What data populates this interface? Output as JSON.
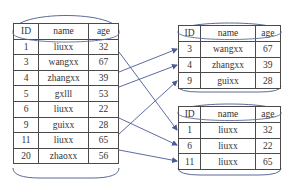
{
  "diagram": {
    "type": "table-partition",
    "columns": [
      "ID",
      "name",
      "age"
    ],
    "source_table": {
      "rows": [
        [
          "1",
          "liuxx",
          "32"
        ],
        [
          "3",
          "wangxx",
          "67"
        ],
        [
          "4",
          "zhangxx",
          "39"
        ],
        [
          "5",
          "gxlll",
          "53"
        ],
        [
          "6",
          "liuxx",
          "22"
        ],
        [
          "9",
          "guixx",
          "28"
        ],
        [
          "11",
          "liuxx",
          "65"
        ],
        [
          "20",
          "zhaoxx",
          "56"
        ]
      ]
    },
    "target_table_top": {
      "rows": [
        [
          "3",
          "wangxx",
          "67"
        ],
        [
          "4",
          "zhangxx",
          "39"
        ],
        [
          "9",
          "guixx",
          "28"
        ]
      ]
    },
    "target_table_bottom": {
      "rows": [
        [
          "1",
          "liuxx",
          "32"
        ],
        [
          "6",
          "liuxx",
          "22"
        ],
        [
          "11",
          "liuxx",
          "65"
        ]
      ]
    },
    "arrows": [
      {
        "from_id": "3",
        "to": "top",
        "to_id": "3"
      },
      {
        "from_id": "4",
        "to": "top",
        "to_id": "4"
      },
      {
        "from_id": "9",
        "to": "top",
        "to_id": "9"
      },
      {
        "from_id": "1",
        "to": "bottom",
        "to_id": "1"
      },
      {
        "from_id": "6",
        "to": "bottom",
        "to_id": "6"
      },
      {
        "from_id": "11",
        "to": "bottom",
        "to_id": "11"
      }
    ],
    "colors": {
      "border": "#4a4a4a",
      "arrow": "#4a5a9a",
      "cylinder": "#5a6a9a",
      "text": "#333333"
    }
  }
}
